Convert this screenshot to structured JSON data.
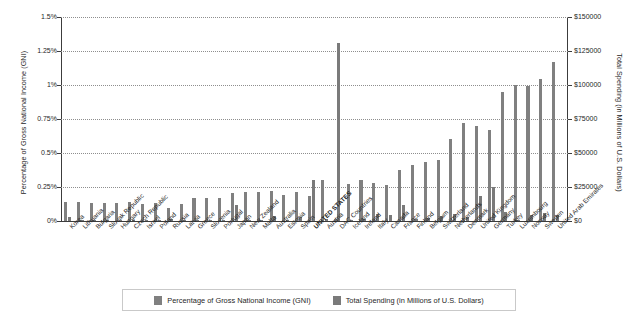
{
  "chart_data": {
    "type": "bar",
    "title": "",
    "subtitle": "",
    "xlabel": "",
    "ylabel": "Percentage of Gross National Income (GNI)",
    "y2label": "Total Spending (in Millions of U.S. Dollars)",
    "grid": true,
    "legend_position": "bottom",
    "ylim": [
      0,
      1.5
    ],
    "y2lim": [
      0,
      150000
    ],
    "yticks": [
      "0%",
      "0.25%",
      "0.5%",
      "0.75%",
      "1%",
      "1.25%",
      "1.5%"
    ],
    "ytick_values": [
      0,
      0.25,
      0.5,
      0.75,
      1.0,
      1.25,
      1.5
    ],
    "y2ticks": [
      "$0",
      "$25000",
      "$50000",
      "$75000",
      "$100000",
      "$125000",
      "$150000"
    ],
    "y2tick_values": [
      0,
      25000,
      50000,
      75000,
      100000,
      125000,
      150000
    ],
    "categories": [
      "Korea",
      "Lithuania",
      "Bulgaria",
      "Slovak Republic",
      "Hungary",
      "Czech Republic",
      "Israel",
      "Poland",
      "Russia",
      "Latvia",
      "Greece",
      "Slovenia",
      "Portugal",
      "Japan",
      "New Zealand",
      "Malta",
      "Australia",
      "Estonia",
      "Spain",
      "UNITED STATES",
      "Austria",
      "DAC Countries",
      "Iceland",
      "Ireland",
      "Italy",
      "Canada",
      "France",
      "Finland",
      "Belgium",
      "Switzerland",
      "Netherlands",
      "Denmark",
      "United Kingdom",
      "Germany",
      "Turkey",
      "Luxembourg",
      "Norway",
      "Sweden",
      "United Arab Emirates"
    ],
    "series": [
      {
        "name": "Percentage of Gross National Income (GNI)",
        "unit": "percent",
        "axis": "left",
        "color": "#808080",
        "values": [
          0.14,
          0.14,
          0.13,
          0.13,
          0.13,
          0.14,
          0.12,
          0.13,
          0.09,
          0.12,
          0.17,
          0.17,
          0.17,
          0.2,
          0.21,
          0.21,
          0.22,
          0.19,
          0.21,
          0.18,
          0.3,
          0.01,
          0.27,
          0.3,
          0.28,
          0.26,
          0.37,
          0.41,
          0.43,
          0.45,
          0.6,
          0.72,
          0.7,
          0.67,
          0.95,
          1.0,
          0.99,
          1.04,
          1.17
        ]
      },
      {
        "name": "Total Spending (in Millions of U.S. Dollars)",
        "unit": "millions_usd",
        "axis": "right",
        "color": "#7a7a7a",
        "values": [
          2500,
          60,
          70,
          110,
          160,
          300,
          300,
          700,
          1200,
          30,
          310,
          80,
          380,
          11500,
          450,
          20,
          3100,
          40,
          2700,
          30000,
          1200,
          131000,
          60,
          900,
          5100,
          4300,
          11300,
          1100,
          2200,
          3100,
          5000,
          2500,
          18000,
          24500,
          6000,
          420,
          4300,
          5500,
          4200
        ]
      }
    ]
  },
  "legend": {
    "items": [
      {
        "label": "Percentage of Gross National Income (GNI)",
        "color": "#808080"
      },
      {
        "label": "Total Spending (in Millions of U.S. Dollars)",
        "color": "#7a7a7a"
      }
    ]
  }
}
